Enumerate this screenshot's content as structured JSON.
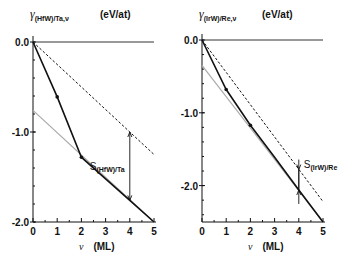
{
  "chart_data": [
    {
      "type": "line",
      "title": "γ(HfW)/Ta,ν",
      "title_main": "γ",
      "title_sub": "(HfW)/Ta,ν",
      "units": "(eV/at)",
      "xlabel": "ν",
      "xlabel_units": "(ML)",
      "xlim": [
        0,
        5
      ],
      "ylim": [
        -2.0,
        0.0
      ],
      "xticks": [
        "0",
        "1",
        "2",
        "3",
        "4",
        "5"
      ],
      "yticks": [
        "0.0",
        "-1.0",
        "-2.0"
      ],
      "series": [
        {
          "name": "zero line",
          "style": "solid-thin",
          "x": [
            0,
            5
          ],
          "y": [
            0.0,
            0.0
          ]
        },
        {
          "name": "dashed",
          "style": "dashed",
          "x": [
            0,
            5
          ],
          "y": [
            0.0,
            -1.25
          ]
        },
        {
          "name": "gray asymptote",
          "style": "gray",
          "x": [
            0,
            5
          ],
          "y": [
            -0.76,
            -2.0
          ]
        },
        {
          "name": "calculated",
          "style": "solid-thick-markers",
          "x": [
            0,
            1,
            2,
            3,
            4,
            5
          ],
          "y": [
            0.0,
            -0.61,
            -1.28,
            -1.52,
            -1.76,
            -2.0
          ]
        }
      ],
      "annotation": {
        "label": "S",
        "sub": "(HfW)/Ta",
        "x": 4,
        "y_from": -1.0,
        "y_to": -1.76
      }
    },
    {
      "type": "line",
      "title": "γ(IrW)/Re,ν",
      "title_main": "γ",
      "title_sub": "(IrW)/Re,ν",
      "units": "(eV/at)",
      "xlabel": "ν",
      "xlabel_units": "(ML)",
      "xlim": [
        0,
        5
      ],
      "ylim": [
        -2.5,
        0.0
      ],
      "xticks": [
        "0",
        "1",
        "2",
        "3",
        "4",
        "5"
      ],
      "yticks": [
        "0.0",
        "-1.0",
        "-2.0"
      ],
      "series": [
        {
          "name": "zero line",
          "style": "solid-thin",
          "x": [
            0,
            5
          ],
          "y": [
            0.0,
            0.0
          ]
        },
        {
          "name": "dashed",
          "style": "dashed",
          "x": [
            0,
            5
          ],
          "y": [
            0.0,
            -2.22
          ]
        },
        {
          "name": "gray asymptote",
          "style": "gray",
          "x": [
            0,
            5
          ],
          "y": [
            -0.35,
            -2.5
          ]
        },
        {
          "name": "calculated",
          "style": "solid-thick-markers",
          "x": [
            0,
            1,
            2,
            3,
            4,
            5
          ],
          "y": [
            0.0,
            -0.68,
            -1.17,
            -1.61,
            -2.06,
            -2.5
          ]
        }
      ],
      "annotation": {
        "label": "S",
        "sub": "(IrW)/Re",
        "x": 4,
        "y_from": -1.78,
        "y_to": -2.06
      }
    }
  ]
}
